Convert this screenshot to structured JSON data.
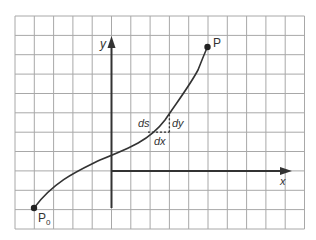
{
  "diagram": {
    "labels": {
      "y_axis": "y",
      "x_axis": "x",
      "end_point": "P",
      "start_point": "P",
      "start_subscript": "0",
      "ds": "ds",
      "dx": "dx",
      "dy": "dy"
    },
    "grid": {
      "columns": 15,
      "rows": 11,
      "color": "#9a9a9a"
    },
    "colors": {
      "axis": "#333333",
      "curve": "#333333",
      "text": "#333333",
      "background": "#ffffff"
    }
  }
}
